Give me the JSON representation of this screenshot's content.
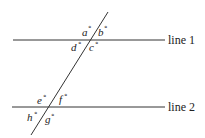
{
  "diagram": {
    "lines": [
      {
        "id": "line1",
        "label": "line 1"
      },
      {
        "id": "line2",
        "label": "line 2"
      }
    ],
    "angles": {
      "a": "a",
      "b": "b",
      "c": "c",
      "d": "d",
      "e": "e",
      "f": "f",
      "g": "g",
      "h": "h"
    },
    "degree_symbol": "°",
    "colors": {
      "stroke": "#333333",
      "text": "#222222"
    }
  }
}
